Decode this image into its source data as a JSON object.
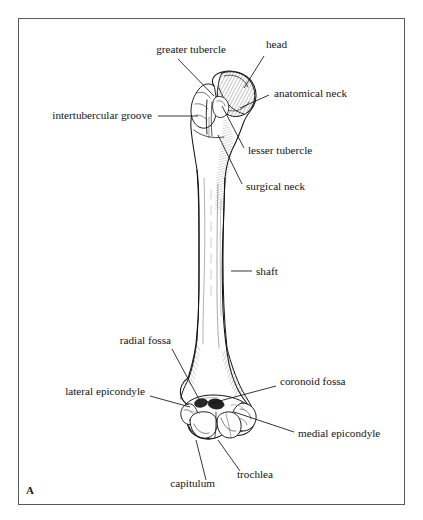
{
  "figure": {
    "panel_label": "A",
    "view": "anterior",
    "frame_color": "#5a5a5a",
    "ink_color": "#141414",
    "background_color": "#ffffff"
  },
  "labels": [
    {
      "id": "greater-tubercle",
      "text": "greater tubercle",
      "align": "left",
      "x": 226,
      "y": 52,
      "leader": {
        "x1": 178,
        "y1": 59,
        "x2": 214,
        "y2": 96
      }
    },
    {
      "id": "head",
      "text": "head",
      "align": "left",
      "x": 287,
      "y": 47,
      "leader": {
        "x1": 264,
        "y1": 56,
        "x2": 244,
        "y2": 88
      }
    },
    {
      "id": "anatomical-neck",
      "text": "anatomical neck",
      "align": "right",
      "x": 274,
      "y": 96,
      "leader": {
        "x1": 269,
        "y1": 95,
        "x2": 240,
        "y2": 108
      }
    },
    {
      "id": "intertubercular-groove",
      "text": "intertubercular groove",
      "align": "left",
      "x": 152,
      "y": 118,
      "leader": {
        "x1": 158,
        "y1": 116,
        "x2": 198,
        "y2": 116
      }
    },
    {
      "id": "lesser-tubercle",
      "text": "lesser tubercle",
      "align": "right",
      "x": 248,
      "y": 153,
      "leader": {
        "x1": 244,
        "y1": 148,
        "x2": 222,
        "y2": 106
      }
    },
    {
      "id": "surgical-neck",
      "text": "surgical neck",
      "align": "right",
      "x": 246,
      "y": 189,
      "leader": {
        "x1": 242,
        "y1": 184,
        "x2": 218,
        "y2": 135
      }
    },
    {
      "id": "shaft",
      "text": "shaft",
      "align": "right",
      "x": 256,
      "y": 274,
      "leader": {
        "x1": 252,
        "y1": 271,
        "x2": 231,
        "y2": 271
      }
    },
    {
      "id": "radial-fossa",
      "text": "radial fossa",
      "align": "left",
      "x": 171,
      "y": 343,
      "leader": {
        "x1": 172,
        "y1": 349,
        "x2": 200,
        "y2": 401
      }
    },
    {
      "id": "lateral-epicondyle",
      "text": "lateral epicondyle",
      "align": "left",
      "x": 145,
      "y": 394,
      "leader": {
        "x1": 150,
        "y1": 396,
        "x2": 190,
        "y2": 407
      }
    },
    {
      "id": "coronoid-fossa",
      "text": "coronoid fossa",
      "align": "right",
      "x": 280,
      "y": 384,
      "leader": {
        "x1": 276,
        "y1": 386,
        "x2": 212,
        "y2": 403
      }
    },
    {
      "id": "medial-epicondyle",
      "text": "medial epicondyle",
      "align": "right",
      "x": 298,
      "y": 436,
      "leader": {
        "x1": 294,
        "y1": 432,
        "x2": 234,
        "y2": 412
      }
    },
    {
      "id": "capitulum",
      "text": "capitulum",
      "align": "left",
      "x": 215,
      "y": 486,
      "leader": {
        "x1": 206,
        "y1": 480,
        "x2": 196,
        "y2": 440
      }
    },
    {
      "id": "trochlea",
      "text": "trochlea",
      "align": "right",
      "x": 237,
      "y": 477,
      "leader": {
        "x1": 240,
        "y1": 471,
        "x2": 218,
        "y2": 440
      }
    }
  ]
}
